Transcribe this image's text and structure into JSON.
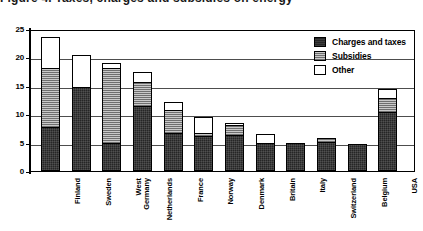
{
  "figure": {
    "title": "Figure 4. Taxes, charges and subsidies on energy"
  },
  "legend": {
    "position": "top-right-inside",
    "entries": [
      {
        "label": "Charges and taxes",
        "key": "charges",
        "color": "#262626"
      },
      {
        "label": "Subsidies",
        "key": "subsidies",
        "color": "#9a9a9a"
      },
      {
        "label": "Other",
        "key": "other",
        "color": "#ffffff"
      }
    ]
  },
  "axis": {
    "y_ticks": [
      "0",
      "5",
      "10",
      "15",
      "20",
      "25"
    ],
    "y_tick_values": [
      0,
      5,
      10,
      15,
      20,
      25
    ]
  },
  "chart_data": {
    "type": "bar",
    "subtype": "stacked-vertical",
    "title": "Figure 4. Taxes, charges and subsidies on energy",
    "xlabel": "",
    "ylabel": "",
    "ylim": [
      0,
      25
    ],
    "ytick_step": 5,
    "grid": true,
    "legend_position": "top-right-inside",
    "categories": [
      "Finland",
      "Sweden",
      "West\nGermany",
      "Netherlands",
      "France",
      "Norway",
      "Denmark",
      "Britain",
      "Italy",
      "Switzerland",
      "Belgium",
      "USA"
    ],
    "categories_flat": [
      "Finland",
      "Sweden",
      "West Germany",
      "Netherlands",
      "France",
      "Norway",
      "Denmark",
      "Britain",
      "Italy",
      "Switzerland",
      "Belgium",
      "USA"
    ],
    "series": [
      {
        "name": "Charges and taxes",
        "color": "#262626",
        "values": [
          7.5,
          14.7,
          4.7,
          11.2,
          6.5,
          6.0,
          6.2,
          4.8,
          4.8,
          5.0,
          4.6,
          10.3
        ]
      },
      {
        "name": "Subsidies",
        "color": "#9a9a9a",
        "values": [
          10.5,
          0.0,
          13.3,
          4.3,
          4.0,
          0.5,
          1.8,
          0.0,
          0.0,
          0.6,
          0.0,
          2.3
        ]
      },
      {
        "name": "Other",
        "color": "#ffffff",
        "values": [
          5.5,
          5.6,
          0.8,
          1.7,
          1.5,
          2.8,
          0.3,
          1.5,
          0.0,
          0.0,
          0.0,
          1.7
        ]
      }
    ],
    "totals": [
      23.5,
      20.3,
      18.8,
      17.2,
      12.0,
      9.3,
      8.3,
      6.3,
      4.8,
      5.6,
      4.6,
      14.3
    ]
  }
}
